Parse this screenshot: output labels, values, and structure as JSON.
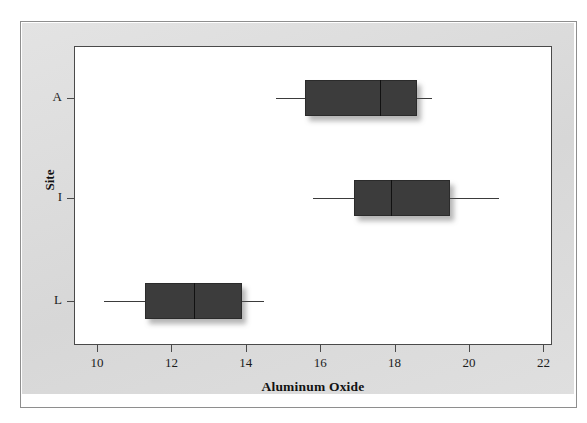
{
  "figure": {
    "background": "#ffffff",
    "panel_color": "#dcdcdc",
    "plot_background": "#ffffff",
    "box_fill": "#3c3c3c",
    "axis_color": "#4a4a4a"
  },
  "chart_data": {
    "type": "box",
    "orientation": "horizontal",
    "title": "",
    "xlabel": "Aluminum Oxide",
    "ylabel": "Site",
    "xlim": [
      9.3,
      22.2
    ],
    "xticks": [
      10,
      12,
      14,
      16,
      18,
      20,
      22
    ],
    "xticklabels": [
      "10",
      "12",
      "14",
      "16",
      "18",
      "20",
      "22"
    ],
    "categories": [
      "A",
      "I",
      "L"
    ],
    "grid": false,
    "legend": null,
    "boxes": [
      {
        "category": "A",
        "whisker_low": 14.8,
        "q1": 15.6,
        "median": 17.6,
        "q3": 18.6,
        "whisker_high": 19.0
      },
      {
        "category": "I",
        "whisker_low": 15.8,
        "q1": 16.9,
        "median": 17.9,
        "q3": 19.5,
        "whisker_high": 20.8
      },
      {
        "category": "L",
        "whisker_low": 10.2,
        "q1": 11.3,
        "median": 12.6,
        "q3": 13.9,
        "whisker_high": 14.5
      }
    ]
  }
}
